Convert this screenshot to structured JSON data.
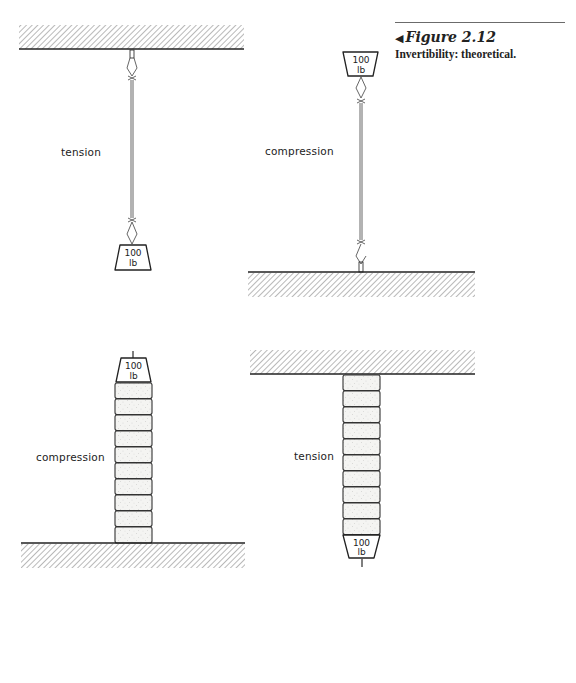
{
  "caption": {
    "arrow_icon": "◀",
    "figure_label": "Figure 2.12",
    "text": "Invertibility: theoretical."
  },
  "panels": [
    {
      "id": "top-left",
      "label": "tension",
      "support": "ceiling",
      "member": "string",
      "weight": {
        "value": "100",
        "unit": "lb"
      }
    },
    {
      "id": "top-right",
      "label": "compression",
      "support": "ground",
      "member": "string",
      "weight": {
        "value": "100",
        "unit": "lb"
      }
    },
    {
      "id": "bottom-left",
      "label": "compression",
      "support": "ground",
      "member": "stacked blocks",
      "block_count": 10,
      "weight": {
        "value": "100",
        "unit": "lb"
      }
    },
    {
      "id": "bottom-right",
      "label": "tension",
      "support": "ceiling",
      "member": "stacked blocks",
      "block_count": 10,
      "weight": {
        "value": "100",
        "unit": "lb"
      }
    }
  ],
  "colors": {
    "ink": "#222222",
    "hatch": "#8a8a8a",
    "block_fill": "#f4f4f2"
  }
}
